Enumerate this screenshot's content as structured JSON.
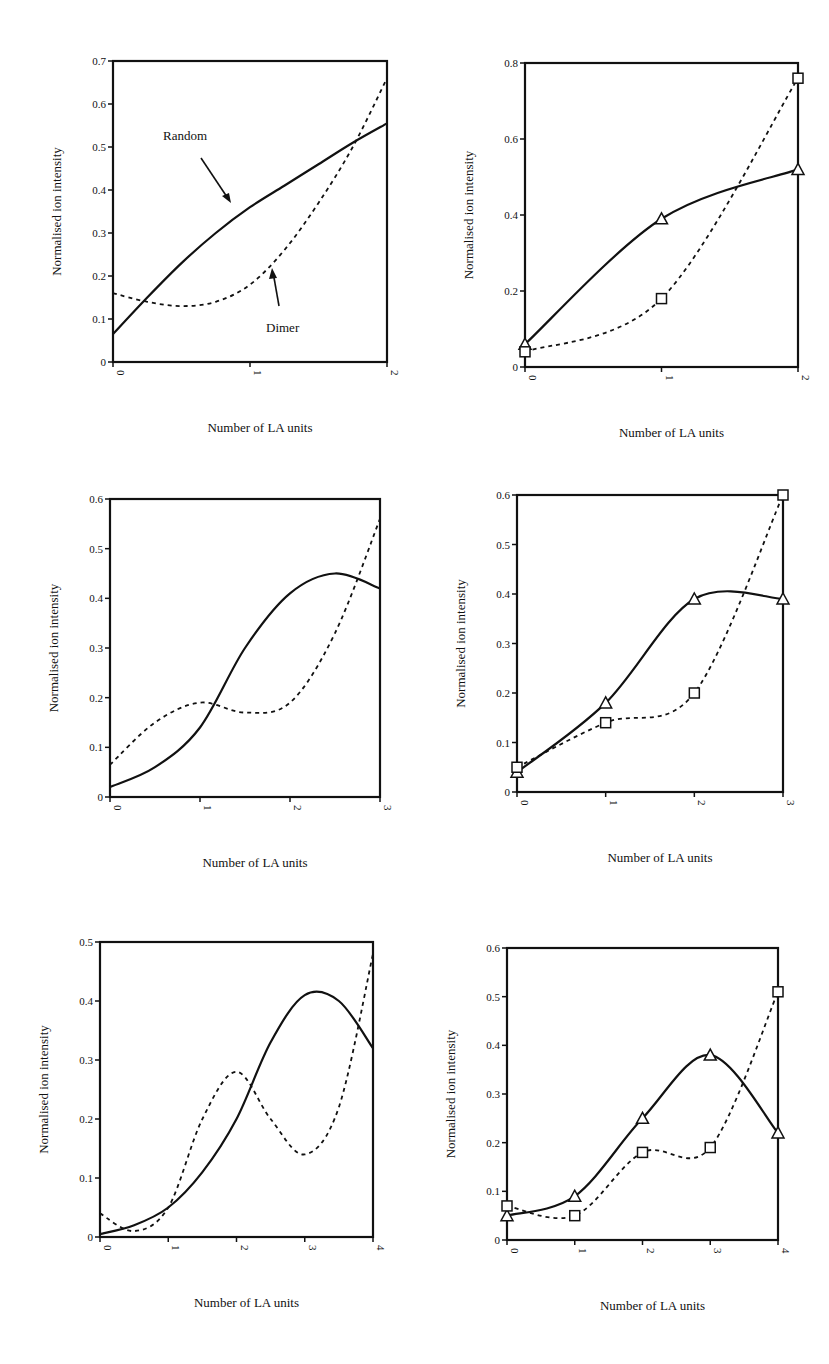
{
  "chart_data": [
    {
      "id": "panel-1",
      "type": "line",
      "title": "",
      "xlabel": "Number of LA units",
      "ylabel": "Normalised ion intensity",
      "xlim": [
        0,
        2
      ],
      "ylim": [
        0,
        0.7
      ],
      "xticks": [
        "0",
        "1",
        "2"
      ],
      "yticks": [
        "0",
        "0.1",
        "0.2",
        "0.3",
        "0.4",
        "0.5",
        "0.6",
        "0.7"
      ],
      "grid": false,
      "markers": false,
      "annotations": [
        {
          "text": "Random",
          "target_series": "Random"
        },
        {
          "text": "Dimer",
          "target_series": "Dimer"
        }
      ],
      "series": [
        {
          "name": "Random",
          "style": "solid",
          "x": [
            0,
            0.25,
            0.5,
            0.75,
            1.0,
            1.25,
            1.5,
            1.75,
            2.0
          ],
          "values": [
            0.065,
            0.15,
            0.23,
            0.3,
            0.36,
            0.41,
            0.46,
            0.51,
            0.555
          ]
        },
        {
          "name": "Dimer",
          "style": "dashed",
          "x": [
            0,
            0.25,
            0.5,
            0.75,
            1.0,
            1.25,
            1.5,
            1.75,
            2.0
          ],
          "values": [
            0.16,
            0.14,
            0.13,
            0.14,
            0.18,
            0.26,
            0.37,
            0.5,
            0.66
          ]
        }
      ]
    },
    {
      "id": "panel-2",
      "type": "line",
      "title": "",
      "xlabel": "Number of LA units",
      "ylabel": "Normalised ion intensity",
      "xlim": [
        0,
        2
      ],
      "ylim": [
        0,
        0.8
      ],
      "xticks": [
        "0",
        "1",
        "2"
      ],
      "yticks": [
        "0",
        "0.2",
        "0.4",
        "0.6",
        "0.8"
      ],
      "grid": false,
      "markers": true,
      "series": [
        {
          "name": "Random",
          "style": "solid",
          "marker": "triangle",
          "x": [
            0,
            1,
            2
          ],
          "values": [
            0.06,
            0.39,
            0.52
          ]
        },
        {
          "name": "Dimer",
          "style": "dashed",
          "marker": "square",
          "x": [
            0,
            1,
            2
          ],
          "values": [
            0.04,
            0.18,
            0.76
          ]
        }
      ]
    },
    {
      "id": "panel-3",
      "type": "line",
      "title": "",
      "xlabel": "Number of LA units",
      "ylabel": "Normalised ion intensity",
      "xlim": [
        0,
        3
      ],
      "ylim": [
        0,
        0.6
      ],
      "xticks": [
        "0",
        "1",
        "2",
        "3"
      ],
      "yticks": [
        "0",
        "0.1",
        "0.2",
        "0.3",
        "0.4",
        "0.5",
        "0.6"
      ],
      "grid": false,
      "markers": false,
      "series": [
        {
          "name": "Random",
          "style": "solid",
          "x": [
            0,
            0.5,
            1.0,
            1.5,
            2.0,
            2.5,
            3.0
          ],
          "values": [
            0.02,
            0.06,
            0.14,
            0.3,
            0.41,
            0.45,
            0.42
          ]
        },
        {
          "name": "Dimer",
          "style": "dashed",
          "x": [
            0,
            0.5,
            1.0,
            1.5,
            2.0,
            2.5,
            3.0
          ],
          "values": [
            0.065,
            0.15,
            0.19,
            0.17,
            0.19,
            0.33,
            0.56
          ]
        }
      ]
    },
    {
      "id": "panel-4",
      "type": "line",
      "title": "",
      "xlabel": "Number of LA units",
      "ylabel": "Normalised ion intensity",
      "xlim": [
        0,
        3
      ],
      "ylim": [
        0,
        0.6
      ],
      "xticks": [
        "0",
        "1",
        "2",
        "3"
      ],
      "yticks": [
        "0",
        "0.1",
        "0.2",
        "0.3",
        "0.4",
        "0.5",
        "0.6"
      ],
      "grid": false,
      "markers": true,
      "series": [
        {
          "name": "Random",
          "style": "solid",
          "marker": "triangle",
          "x": [
            0,
            1,
            2,
            3
          ],
          "values": [
            0.04,
            0.18,
            0.39,
            0.39
          ]
        },
        {
          "name": "Dimer",
          "style": "dashed",
          "marker": "square",
          "x": [
            0,
            1,
            2,
            3
          ],
          "values": [
            0.05,
            0.14,
            0.2,
            0.6
          ]
        }
      ]
    },
    {
      "id": "panel-5",
      "type": "line",
      "title": "",
      "xlabel": "Number of LA units",
      "ylabel": "Normalised ion intensity",
      "xlim": [
        0,
        4
      ],
      "ylim": [
        0,
        0.5
      ],
      "xticks": [
        "0",
        "1",
        "2",
        "3",
        "4"
      ],
      "yticks": [
        "0",
        "0.1",
        "0.2",
        "0.3",
        "0.4",
        "0.5"
      ],
      "grid": false,
      "markers": false,
      "series": [
        {
          "name": "Random",
          "style": "solid",
          "x": [
            0,
            0.5,
            1.0,
            1.5,
            2.0,
            2.5,
            3.0,
            3.5,
            4.0
          ],
          "values": [
            0.005,
            0.02,
            0.05,
            0.11,
            0.2,
            0.33,
            0.41,
            0.4,
            0.32
          ]
        },
        {
          "name": "Dimer",
          "style": "dashed",
          "x": [
            0,
            0.5,
            1.0,
            1.5,
            2.0,
            2.5,
            3.0,
            3.5,
            4.0
          ],
          "values": [
            0.04,
            0.01,
            0.05,
            0.2,
            0.28,
            0.2,
            0.14,
            0.22,
            0.48
          ]
        }
      ]
    },
    {
      "id": "panel-6",
      "type": "line",
      "title": "",
      "xlabel": "Number of LA units",
      "ylabel": "Normalised ion intensity",
      "xlim": [
        0,
        4
      ],
      "ylim": [
        0,
        0.6
      ],
      "xticks": [
        "0",
        "1",
        "2",
        "3",
        "4"
      ],
      "yticks": [
        "0",
        "0.1",
        "0.2",
        "0.3",
        "0.4",
        "0.5",
        "0.6"
      ],
      "grid": false,
      "markers": true,
      "series": [
        {
          "name": "Random",
          "style": "solid",
          "marker": "triangle",
          "x": [
            0,
            1,
            2,
            3,
            4
          ],
          "values": [
            0.05,
            0.09,
            0.25,
            0.38,
            0.22
          ]
        },
        {
          "name": "Dimer",
          "style": "dashed",
          "marker": "square",
          "x": [
            0,
            1,
            2,
            3,
            4
          ],
          "values": [
            0.07,
            0.05,
            0.18,
            0.19,
            0.51
          ]
        }
      ]
    }
  ],
  "labels": {
    "xlabel": "Number of LA units",
    "ylabel": "Normalised ion intensity",
    "random": "Random",
    "dimer": "Dimer"
  }
}
